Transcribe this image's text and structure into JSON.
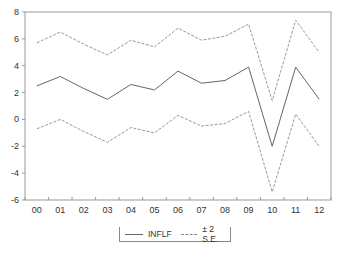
{
  "chart_data": {
    "type": "line",
    "title": "",
    "xlabel": "",
    "ylabel": "",
    "x": [
      "00",
      "01",
      "02",
      "03",
      "04",
      "05",
      "06",
      "07",
      "08",
      "09",
      "10",
      "11",
      "12"
    ],
    "series": [
      {
        "name": "INFLF",
        "style": "solid",
        "color": "#666666",
        "values": [
          2.5,
          3.2,
          2.3,
          1.5,
          2.6,
          2.2,
          3.6,
          2.7,
          2.9,
          3.9,
          -2.0,
          3.9,
          1.5
        ]
      },
      {
        "name": "± 2 S.E.",
        "role": "upper",
        "style": "dashed",
        "color": "#999999",
        "values": [
          5.7,
          6.5,
          5.6,
          4.8,
          5.9,
          5.4,
          6.8,
          5.9,
          6.2,
          7.1,
          1.4,
          7.4,
          5.0
        ]
      },
      {
        "name": "± 2 S.E.",
        "role": "lower",
        "style": "dashed",
        "color": "#999999",
        "values": [
          -0.7,
          0.0,
          -0.9,
          -1.7,
          -0.6,
          -1.0,
          0.3,
          -0.5,
          -0.3,
          0.6,
          -5.4,
          0.4,
          -2.0
        ]
      }
    ],
    "yticks": [
      8,
      6,
      4,
      2,
      0,
      -2,
      -4,
      -6
    ],
    "ylim": [
      -6,
      8
    ],
    "grid": false,
    "legend_position": "bottom-center"
  },
  "legend": {
    "items": [
      {
        "label": "INFLF"
      },
      {
        "label": "± 2 S.E."
      }
    ]
  }
}
